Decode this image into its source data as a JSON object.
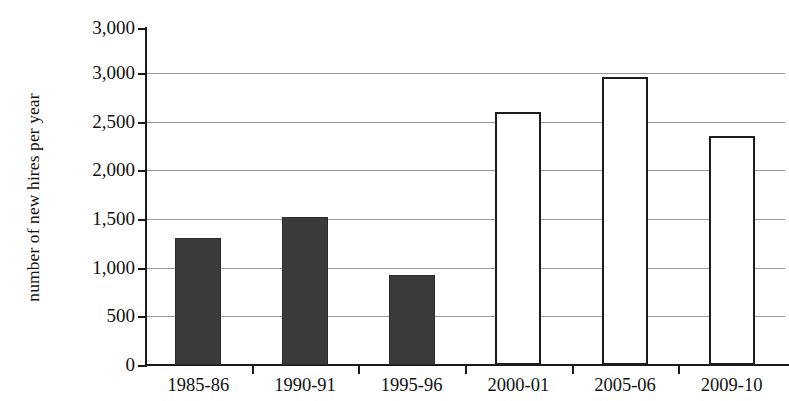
{
  "chart_data": {
    "type": "bar",
    "title": "",
    "subtitle": "",
    "xlabel": "",
    "ylabel": "number of new hires per year",
    "categories": [
      "1985-86",
      "1990-91",
      "1995-96",
      "2000-01",
      "2005-06",
      "2009-10"
    ],
    "values": [
      1300,
      1520,
      920,
      2600,
      2960,
      2350
    ],
    "series": [
      {
        "name": "number of new hires per year",
        "values": [
          1300,
          1520,
          920,
          2600,
          2960,
          2350
        ]
      }
    ],
    "bar_styles": [
      "filled",
      "filled",
      "filled",
      "hollow",
      "hollow",
      "hollow"
    ],
    "ylim": [
      0,
      3000
    ],
    "ytick_values": [
      0,
      500,
      1000,
      1500,
      2000,
      2500,
      3000
    ],
    "ytick_labels": [
      "0",
      "500",
      "1,000",
      "1,500",
      "2,000",
      "2,500",
      "3,000"
    ],
    "axis_top_label": "3,000",
    "grid": true,
    "grid_axis": "y",
    "legend": "none",
    "colors": {
      "filled_bar": "#3a3a3a",
      "hollow_bar_fill": "#ffffff",
      "hollow_bar_stroke": "#1c1c1c",
      "gridline": "#9a9a9a",
      "axis": "#1a1a1a",
      "text": "#101010",
      "background": "#ffffff"
    }
  }
}
